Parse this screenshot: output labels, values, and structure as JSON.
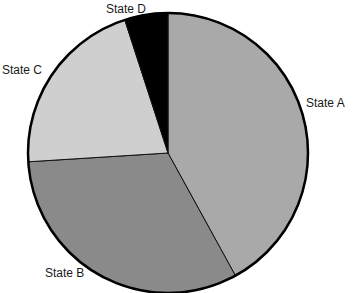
{
  "chart_data": {
    "type": "pie",
    "title": "",
    "categories": [
      "State A",
      "State B",
      "State C",
      "State D"
    ],
    "values": [
      42,
      32,
      21,
      5
    ],
    "colors": [
      "#a9a9a9",
      "#8a8a8a",
      "#cfcfcf",
      "#000000"
    ],
    "start_angle_deg": 0,
    "direction": "clockwise",
    "legend": "none (direct labels)"
  },
  "labels": {
    "a": "State A",
    "b": "State B",
    "c": "State C",
    "d": "State D"
  }
}
